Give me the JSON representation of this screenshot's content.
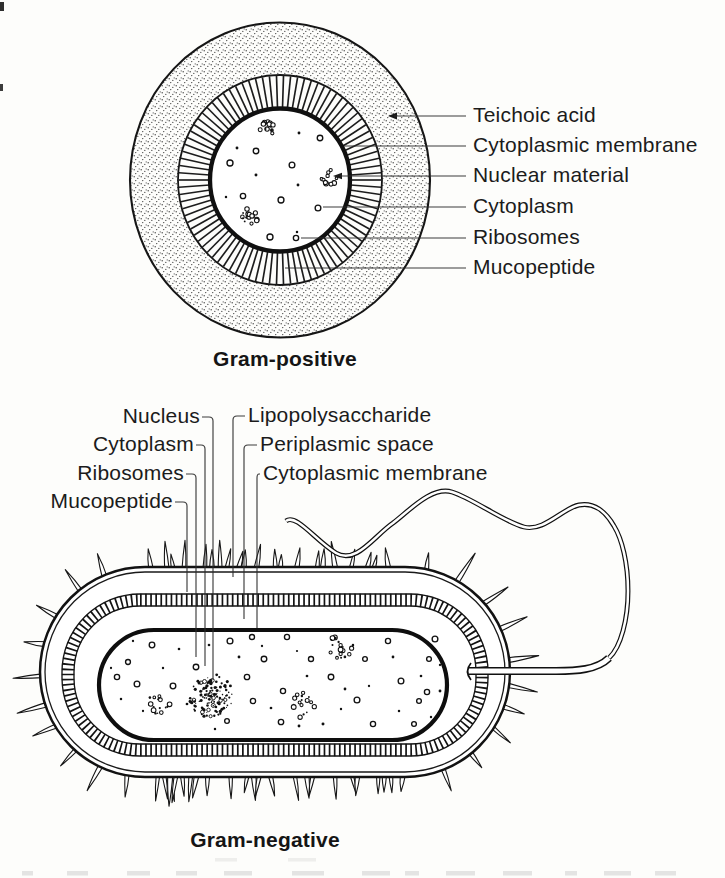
{
  "figure": {
    "paper_color": "#fdfdfb",
    "ink_color": "#1a1a1a"
  },
  "gram_positive": {
    "caption": "Gram-positive",
    "labels": [
      "Teichoic acid",
      "Cytoplasmic membrane",
      "Nuclear material",
      "Cytoplasm",
      "Ribosomes",
      "Mucopeptide"
    ]
  },
  "gram_negative": {
    "caption": "Gram-negative",
    "labels_left": [
      "Nucleus",
      "Cytoplasm",
      "Ribosomes",
      "Mucopeptide"
    ],
    "labels_right": [
      "Lipopolysaccharide",
      "Periplasmic space",
      "Cytoplasmic membrane"
    ]
  }
}
